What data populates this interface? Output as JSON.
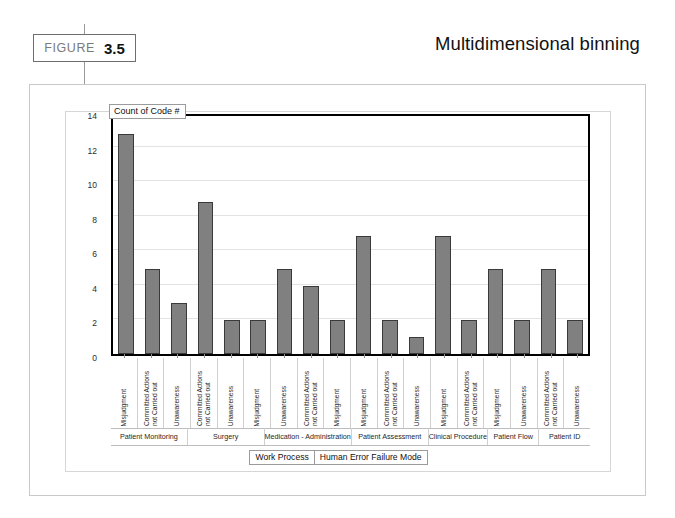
{
  "figure": {
    "word": "FIGURE",
    "number": "3.5",
    "title": "Multidimensional binning"
  },
  "chart_data": {
    "type": "bar",
    "title": "Count of Code #",
    "xlabel": "Human Error Failure Mode",
    "group_axis_label": "Work Process",
    "ylabel": "",
    "ylim": [
      0,
      14
    ],
    "yticks": [
      0,
      2,
      4,
      6,
      8,
      10,
      12,
      14
    ],
    "grid": true,
    "legend": "none",
    "bar_color": "#808080",
    "bar_border_color": "#3a3a3a",
    "categories": [
      "Misjudgment",
      "Committed Actions\nnot Carried out",
      "Unawareness",
      "Committed Actions\nnot Carried out",
      "Unawareness",
      "Misjudgment",
      "Unawareness",
      "Committed Actions\nnot Carried out",
      "Misjudgment",
      "Misjudgment",
      "Committed Actions\nnot Carried out",
      "Unawareness",
      "Misjudgment",
      "Committed Actions\nnot Carried out",
      "Misjudgment",
      "Unawareness",
      "Committed Actions\nnot Carried out",
      "Unawareness"
    ],
    "values": [
      13,
      5,
      3,
      9,
      2,
      2,
      5,
      4,
      2,
      7,
      2,
      1,
      7,
      2,
      5,
      2,
      5,
      2
    ],
    "groups": [
      {
        "label": "Patient Monitoring",
        "span": 3
      },
      {
        "label": "Surgery",
        "span": 3
      },
      {
        "label": "Medication - Administration",
        "span": 3
      },
      {
        "label": "Patient Assessment",
        "span": 3
      },
      {
        "label": "Clinical Procedure",
        "span": 2
      },
      {
        "label": "Patient Flow",
        "span": 2
      },
      {
        "label": "Patient ID",
        "span": 2
      }
    ]
  }
}
